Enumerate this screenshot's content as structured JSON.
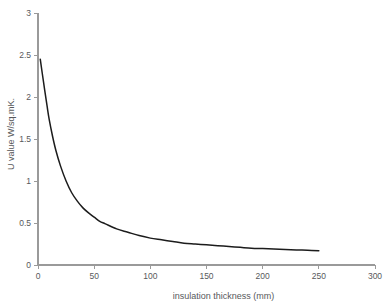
{
  "chart_data": {
    "type": "line",
    "title": "",
    "subtitle": "",
    "xlabel": "insulation thickness (mm)",
    "ylabel": "U value W/sq.mK.",
    "xlim": [
      0,
      300
    ],
    "ylim": [
      0,
      3
    ],
    "xticks": [
      0,
      50,
      100,
      150,
      200,
      250,
      300
    ],
    "xtick_labels": [
      "0",
      "50",
      "100",
      "150",
      "200",
      "250",
      "300"
    ],
    "yticks": [
      0,
      0.5,
      1,
      1.5,
      2,
      2.5,
      3
    ],
    "ytick_labels": [
      "0",
      "0.5",
      "1",
      "1.5",
      "2",
      "2.5",
      "3"
    ],
    "grid": false,
    "legend": false,
    "legend_position": "none",
    "curve_color": "#1c1c1c",
    "axis_color": "#9a9a9a",
    "text_color": "#58595b",
    "background_color": "#ffffff",
    "series": [
      {
        "name": "U value",
        "x": [
          2,
          5,
          8,
          10,
          13,
          16,
          20,
          25,
          30,
          35,
          40,
          45,
          50,
          55,
          60,
          70,
          80,
          90,
          100,
          110,
          120,
          130,
          140,
          150,
          160,
          170,
          180,
          190,
          200,
          210,
          220,
          230,
          240,
          250
        ],
        "y": [
          2.45,
          2.17,
          1.9,
          1.73,
          1.53,
          1.36,
          1.18,
          1.0,
          0.86,
          0.76,
          0.68,
          0.62,
          0.57,
          0.52,
          0.49,
          0.43,
          0.39,
          0.35,
          0.32,
          0.3,
          0.28,
          0.26,
          0.25,
          0.24,
          0.23,
          0.22,
          0.21,
          0.2,
          0.195,
          0.19,
          0.185,
          0.18,
          0.175,
          0.17
        ]
      }
    ],
    "annotations": []
  },
  "plot_geometry": {
    "origin_x": 38,
    "origin_y": 265,
    "x_axis_end": 375,
    "y_axis_top": 13,
    "tick_len": 4
  }
}
